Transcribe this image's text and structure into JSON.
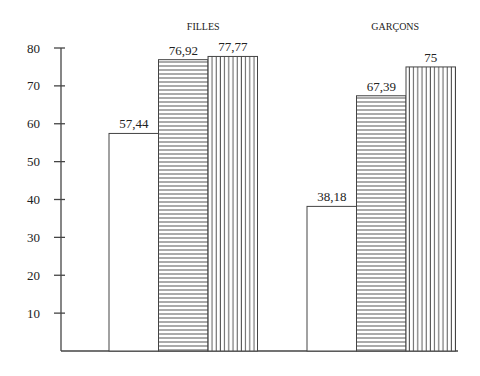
{
  "chart_data": {
    "type": "bar",
    "title": "",
    "xlabel": "",
    "ylabel": "",
    "ylim": [
      0,
      80
    ],
    "yticks": [
      10,
      20,
      30,
      40,
      50,
      60,
      70,
      80
    ],
    "grid": false,
    "legend": "none",
    "categories": [
      "FILLES",
      "GARÇONS"
    ],
    "series": [
      {
        "name": "series-1",
        "pattern": "blank",
        "values": [
          57.44,
          38.18
        ],
        "labels": [
          "57,44",
          "38,18"
        ]
      },
      {
        "name": "series-2",
        "pattern": "horizontal-hatch",
        "values": [
          76.92,
          67.39
        ],
        "labels": [
          "76,92",
          "67,39"
        ]
      },
      {
        "name": "series-3",
        "pattern": "vertical-hatch",
        "values": [
          77.77,
          75
        ],
        "labels": [
          "77,77",
          "75"
        ]
      }
    ]
  }
}
